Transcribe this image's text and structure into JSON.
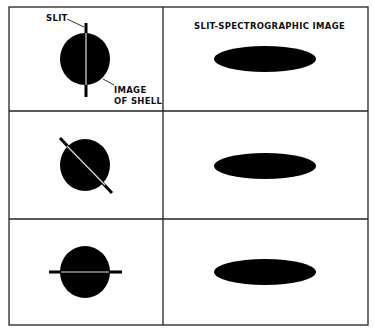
{
  "title_right": "SLIT-SPECTROGRAPHIC IMAGE",
  "labels": {
    "slit": "SLIT",
    "image_of_shell_line1": "IMAGE",
    "image_of_shell_line2": "OF SHELL"
  },
  "rows": [
    {
      "slit_orientation": "vertical",
      "spectrographic_image": "horizontal-ellipse"
    },
    {
      "slit_orientation": "diagonal",
      "spectrographic_image": "horizontal-ellipse"
    },
    {
      "slit_orientation": "horizontal",
      "spectrographic_image": "horizontal-ellipse"
    }
  ],
  "colors": {
    "ink": "#000000",
    "background": "#ffffff",
    "slit": "#d8d8d8"
  }
}
